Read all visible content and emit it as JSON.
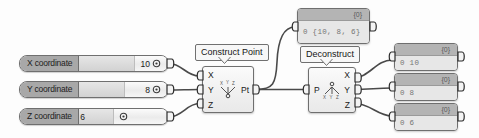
{
  "graph": {
    "title": "Construct and Deconstruct Point node graph",
    "background_color": "#fdfdfd",
    "wire_color": "#4a4a4a",
    "port_color": "#2a2a2a"
  },
  "sliders": [
    {
      "label": "X coordinate",
      "value": "10",
      "knob_icon": "slider-knob-icon",
      "fill_percent": 62
    },
    {
      "label": "Y coordinate",
      "value": "8",
      "knob_icon": "slider-knob-icon",
      "fill_percent": 50
    },
    {
      "label": "Z coordinate",
      "value": "6",
      "knob_icon": "slider-knob-icon",
      "fill_percent": 38
    }
  ],
  "nodes": [
    {
      "id": "construct-point",
      "callout": "Construct Point",
      "inputs": [
        "X",
        "Y",
        "Z"
      ],
      "outputs": [
        "Pt"
      ],
      "glyph": "construct-point-glyph",
      "glyph_top": "X Y Z",
      "glyph_bottom": "o"
    },
    {
      "id": "deconstruct",
      "callout": "Deconstruct",
      "inputs": [
        "P"
      ],
      "outputs": [
        "X",
        "Y",
        "Z"
      ],
      "glyph": "deconstruct-point-glyph",
      "glyph_top": "o",
      "glyph_bottom": "X Y Z"
    }
  ],
  "panels": [
    {
      "id": "panel-point",
      "header": "{0}",
      "text": "0  {10,  8,  6}"
    },
    {
      "id": "panel-x",
      "header": "{0}",
      "text": "0  10"
    },
    {
      "id": "panel-y",
      "header": "{0}",
      "text": "0  8"
    },
    {
      "id": "panel-z",
      "header": "{0}",
      "text": "0  6"
    }
  ]
}
